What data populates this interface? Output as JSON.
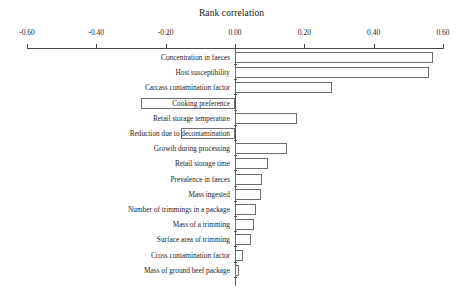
{
  "chart_data": {
    "type": "bar",
    "orientation": "horizontal",
    "subtype": "tornado",
    "title": "Rank correlation",
    "xlabel": "",
    "ylabel": "",
    "xlim": [
      -0.6,
      0.6
    ],
    "xticks": [
      -0.6,
      -0.4,
      -0.2,
      0.0,
      0.2,
      0.4,
      0.6
    ],
    "xticklabels": [
      "-0.60",
      "-0.40",
      "-0.20",
      "0.00",
      "0.20",
      "0.40",
      "0.60"
    ],
    "grid": false,
    "legend": "none",
    "categories": [
      "Concentration in faeces",
      "Host susceptibility",
      "Carcass contamination factor",
      "Cooking preference",
      "Retail storage temperature",
      "Reduction due to decontamination",
      "Growth during processing",
      "Retail storage time",
      "Prevalence in faeces",
      "Mass ingested",
      "Number of trimmings in a package",
      "Mass of a trimming",
      "Surface area of trimming",
      "Cross contamination factor",
      "Mass of ground beef package"
    ],
    "values": [
      0.57,
      0.56,
      0.28,
      -0.27,
      0.18,
      -0.156,
      0.15,
      0.095,
      0.078,
      0.075,
      0.061,
      0.055,
      0.047,
      0.023,
      0.012
    ]
  },
  "axis": {
    "ticks": [
      {
        "label": "-0.60",
        "value": -0.6
      },
      {
        "label": "-0.40",
        "value": -0.4
      },
      {
        "label": "-0.20",
        "value": -0.2
      },
      {
        "label": "0.00",
        "value": 0.0
      },
      {
        "label": "0.20",
        "value": 0.2
      },
      {
        "label": "0.40",
        "value": 0.4
      },
      {
        "label": "0.60",
        "value": 0.6
      }
    ]
  },
  "colors": {
    "bar_fill": "#ffffff",
    "bar_stroke": "#6e6e6e",
    "axis": "#4a4a4a",
    "text": "#1d1d1d",
    "background": "#ffffff"
  }
}
